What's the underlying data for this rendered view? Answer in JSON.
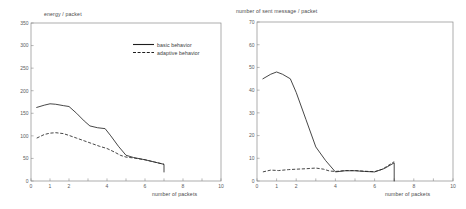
{
  "figure": {
    "panels": [
      "left",
      "right"
    ],
    "line_color": "#262626",
    "axis_color": "#8a8a8a",
    "text_color": "#4a4a4a"
  },
  "legend": {
    "basic_label": "basic behavior",
    "adaptive_label": "adaptive behavior"
  },
  "chart_data": [
    {
      "id": "energy-per-packet",
      "type": "line",
      "title": "",
      "ylabel": "energy / packet",
      "xlabel": "number of packets",
      "xlim": [
        0,
        10
      ],
      "ylim": [
        0,
        350
      ],
      "xticks": [
        0,
        1,
        2,
        3,
        4,
        5,
        6,
        7,
        8,
        9,
        10
      ],
      "xticklabels": [
        "0",
        "1",
        "2",
        "",
        "4",
        "",
        "6",
        "",
        "8",
        "",
        "10"
      ],
      "yticks": [
        0,
        50,
        100,
        150,
        200,
        250,
        300,
        350
      ],
      "yticklabels": [
        "0",
        "50",
        "100",
        "150",
        "200",
        "250",
        "300",
        "350"
      ],
      "grid": false,
      "legend_position": "upper right",
      "series": [
        {
          "name": "basic behavior",
          "style": "solid",
          "x": [
            0.3,
            0.7,
            1.0,
            1.3,
            1.7,
            2.0,
            2.4,
            2.8,
            3.1,
            3.5,
            3.9,
            4.2,
            4.6,
            5.0,
            5.4,
            6.0,
            6.5,
            7.0,
            7.0
          ],
          "y": [
            163,
            168,
            171,
            170,
            167,
            165,
            150,
            133,
            122,
            118,
            116,
            100,
            77,
            57,
            52,
            47,
            42,
            37,
            20
          ]
        },
        {
          "name": "adaptive behavior",
          "style": "dashed",
          "x": [
            0.3,
            0.7,
            1.0,
            1.3,
            1.7,
            2.0,
            2.4,
            2.8,
            3.2,
            3.6,
            4.0,
            4.4,
            4.7,
            5.0,
            5.4,
            6.0,
            6.5,
            7.0
          ],
          "y": [
            95,
            103,
            106,
            107,
            105,
            101,
            95,
            89,
            83,
            77,
            72,
            64,
            57,
            53,
            51,
            47,
            42,
            37
          ]
        }
      ]
    },
    {
      "id": "sent-messages-per-packet",
      "type": "line",
      "title": "",
      "ylabel": "number of sent message / packet",
      "xlabel": "number of packets",
      "xlim": [
        0,
        10
      ],
      "ylim": [
        0,
        70
      ],
      "xticks": [
        0,
        1,
        2,
        3,
        4,
        5,
        6,
        7,
        8,
        9,
        10
      ],
      "xticklabels": [
        "0",
        "1",
        "2",
        "",
        "4",
        "",
        "6",
        "",
        "8",
        "",
        "10"
      ],
      "yticks": [
        0,
        10,
        20,
        30,
        40,
        50,
        60,
        70
      ],
      "yticklabels": [
        "0",
        "10",
        "20",
        "30",
        "40",
        "50",
        "60",
        "70"
      ],
      "grid": false,
      "legend_position": "none",
      "series": [
        {
          "name": "basic behavior",
          "style": "solid",
          "x": [
            0.3,
            0.7,
            1.0,
            1.3,
            1.7,
            2.0,
            2.5,
            3.0,
            3.5,
            4.0,
            4.5,
            5.0,
            5.5,
            6.0,
            6.5,
            7.0,
            7.0
          ],
          "y": [
            45,
            47,
            48,
            47,
            45,
            39,
            27,
            15,
            9,
            4,
            4.5,
            4.5,
            4.2,
            4,
            5.5,
            8,
            0
          ]
        },
        {
          "name": "adaptive behavior",
          "style": "dashed",
          "x": [
            0.3,
            0.7,
            1.1,
            1.6,
            2.0,
            2.5,
            3.0,
            3.4,
            3.7,
            4.0,
            4.5,
            5.0,
            5.5,
            6.0,
            6.4,
            7.0
          ],
          "y": [
            4,
            4.8,
            4.6,
            5.0,
            5.2,
            5.4,
            5.7,
            5.2,
            4.4,
            4.2,
            4.6,
            4.6,
            4.3,
            4.1,
            5.2,
            8.5
          ]
        }
      ]
    }
  ]
}
